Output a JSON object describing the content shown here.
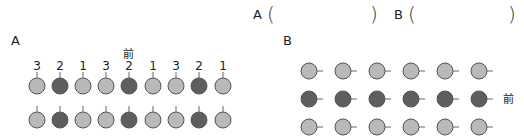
{
  "answer_line": {
    "a_label": "A",
    "a_open": "(",
    "a_close": ")",
    "b_label": "B",
    "b_open": "(",
    "b_close": ")"
  },
  "figure_a": {
    "label": "A",
    "front_label": "前",
    "column_numbers": [
      "3",
      "2",
      "1",
      "3",
      "2",
      "1",
      "3",
      "2",
      "1"
    ],
    "rows": [
      [
        "light",
        "dark",
        "light",
        "light",
        "dark",
        "light",
        "light",
        "dark",
        "light"
      ],
      [
        "light",
        "dark",
        "light",
        "light",
        "dark",
        "light",
        "light",
        "dark",
        "light"
      ]
    ]
  },
  "figure_b": {
    "label": "B",
    "front_label": "前",
    "rows": [
      [
        "light",
        "light",
        "light",
        "light",
        "light",
        "light"
      ],
      [
        "dark",
        "dark",
        "dark",
        "dark",
        "dark",
        "dark"
      ],
      [
        "light",
        "light",
        "light",
        "light",
        "light",
        "light"
      ]
    ]
  },
  "colors": {
    "light": "#b9b9b9",
    "dark": "#5e5e5e",
    "stroke": "#555555"
  }
}
